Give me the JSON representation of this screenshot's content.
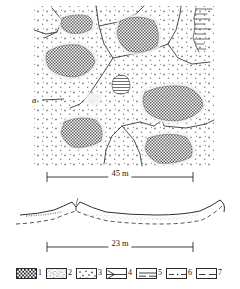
{
  "figure": {
    "panels": [
      {
        "id": "a",
        "label": "a",
        "type": "plan-view-map"
      },
      {
        "id": "b",
        "label": "b",
        "type": "cross-section"
      }
    ]
  },
  "map": {
    "label": "a",
    "scale": {
      "label": "45 m",
      "value": 45,
      "unit": "m"
    }
  },
  "section": {
    "label": "b",
    "annotations": [
      {
        "name": "border",
        "text": "border"
      },
      {
        "name": "depression",
        "text": "depression"
      }
    ],
    "scale": {
      "label": "23 m",
      "value": 23,
      "unit": "m"
    }
  },
  "legend": {
    "items": [
      {
        "num": "1",
        "pattern": "checkerboard",
        "name": "legend-swatch-checkerboard"
      },
      {
        "num": "2",
        "pattern": "dense-stipple",
        "name": "legend-swatch-dense-stipple"
      },
      {
        "num": "3",
        "pattern": "sparse-dots",
        "name": "legend-swatch-sparse-dots"
      },
      {
        "num": "4",
        "pattern": "line-with-arrowhead",
        "name": "legend-swatch-arrow-line"
      },
      {
        "num": "5",
        "pattern": "solid-line-with-dashes",
        "name": "legend-swatch-solid-dashed-line"
      },
      {
        "num": "6",
        "pattern": "dash-dot-line",
        "name": "legend-swatch-dash-dot-line"
      },
      {
        "num": "7",
        "pattern": "dashed-line",
        "name": "legend-swatch-dashed-line"
      }
    ]
  },
  "colors": {
    "ink": "#2a2a2a",
    "fill_checker": "#6e6e6e",
    "stipple": "#8a8a8a",
    "paper": "#ffffff"
  }
}
